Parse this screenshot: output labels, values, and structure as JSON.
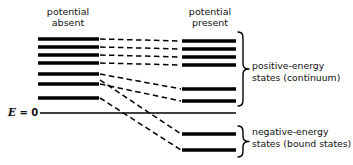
{
  "figure": {
    "background_color": "#ffffff",
    "ink_color": "#000000",
    "columns": {
      "left_title_line1": "potential",
      "left_title_line2": "absent",
      "right_title_line1": "potential",
      "right_title_line2": "present"
    },
    "zero_axis": {
      "symbol": "E",
      "equals": " = ",
      "value": "0",
      "full_label": "E = 0",
      "y": 113,
      "x_start": 40,
      "x_end": 236
    },
    "brace_labels": {
      "positive_line1": "positive-energy",
      "positive_line2": "states (continuum)",
      "negative_line1": "negative-energy",
      "negative_line2": "states (bound states)"
    }
  },
  "chart_data": {
    "type": "line",
    "xlabel": "",
    "ylabel": "Energy",
    "grid": false,
    "legend": "none",
    "axis_note": "Vertical axis is energy; E = 0 separates positive-energy (continuum) states above from negative-energy (bound) states below.",
    "categories": [
      "potential absent",
      "potential present"
    ],
    "left_levels": [
      {
        "index": 1,
        "y": 39,
        "x_start": 38,
        "x_end": 99,
        "sign": "positive"
      },
      {
        "index": 2,
        "y": 47,
        "x_start": 38,
        "x_end": 99,
        "sign": "positive"
      },
      {
        "index": 3,
        "y": 55,
        "x_start": 38,
        "x_end": 99,
        "sign": "positive"
      },
      {
        "index": 4,
        "y": 63,
        "x_start": 38,
        "x_end": 99,
        "sign": "positive"
      },
      {
        "index": 5,
        "y": 74,
        "x_start": 38,
        "x_end": 99,
        "sign": "positive"
      },
      {
        "index": 6,
        "y": 84,
        "x_start": 38,
        "x_end": 99,
        "sign": "positive"
      },
      {
        "index": 7,
        "y": 98,
        "x_start": 38,
        "x_end": 99,
        "sign": "positive"
      }
    ],
    "right_levels": [
      {
        "index": 1,
        "y": 41,
        "x_start": 182,
        "x_end": 236,
        "sign": "positive"
      },
      {
        "index": 2,
        "y": 49,
        "x_start": 182,
        "x_end": 236,
        "sign": "positive"
      },
      {
        "index": 3,
        "y": 57,
        "x_start": 182,
        "x_end": 236,
        "sign": "positive"
      },
      {
        "index": 4,
        "y": 65,
        "x_start": 182,
        "x_end": 236,
        "sign": "positive"
      },
      {
        "index": 5,
        "y": 89,
        "x_start": 182,
        "x_end": 236,
        "sign": "positive"
      },
      {
        "index": 6,
        "y": 101,
        "x_start": 182,
        "x_end": 236,
        "sign": "positive"
      },
      {
        "index": 7,
        "y": 134,
        "x_start": 182,
        "x_end": 236,
        "sign": "negative"
      },
      {
        "index": 8,
        "y": 150,
        "x_start": 182,
        "x_end": 236,
        "sign": "negative"
      }
    ],
    "connectors": [
      {
        "from_level": 1,
        "to_level": 1,
        "x1": 100,
        "y1": 39,
        "x2": 181,
        "y2": 41
      },
      {
        "from_level": 2,
        "to_level": 2,
        "x1": 100,
        "y1": 47,
        "x2": 181,
        "y2": 49
      },
      {
        "from_level": 3,
        "to_level": 3,
        "x1": 100,
        "y1": 55,
        "x2": 181,
        "y2": 57
      },
      {
        "from_level": 4,
        "to_level": 4,
        "x1": 100,
        "y1": 63,
        "x2": 181,
        "y2": 65
      },
      {
        "from_level": 5,
        "to_level": 5,
        "x1": 100,
        "y1": 74,
        "x2": 181,
        "y2": 89
      },
      {
        "from_level": 6,
        "to_level": 6,
        "x1": 100,
        "y1": 84,
        "x2": 181,
        "y2": 101
      },
      {
        "from_level": 6,
        "to_level": 7,
        "x1": 100,
        "y1": 80,
        "x2": 181,
        "y2": 134
      },
      {
        "from_level": 7,
        "to_level": 8,
        "x1": 100,
        "y1": 98,
        "x2": 181,
        "y2": 150
      }
    ],
    "braces": [
      {
        "name": "positive-energy",
        "y_top": 32,
        "y_bottom": 106,
        "x": 243
      },
      {
        "name": "negative-energy",
        "y_top": 126,
        "y_bottom": 157,
        "x": 243
      }
    ]
  }
}
